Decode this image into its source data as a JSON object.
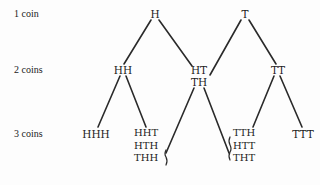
{
  "row_labels": {
    "level1": "1 coin",
    "level2": "2 coins",
    "level3": "3 coins"
  },
  "level1": {
    "left": "H",
    "right": "T"
  },
  "level2": {
    "left": "HH",
    "middle": [
      "HT",
      "TH"
    ],
    "right": "TT"
  },
  "level3": {
    "leftmost": "HHH",
    "left_group": [
      "HHT",
      "HTH",
      "THH"
    ],
    "right_group": [
      "TTH",
      "HTT",
      "THT"
    ],
    "rightmost": "TTT"
  },
  "colors": {
    "line": "#2a2a2a",
    "text": "#222222"
  }
}
